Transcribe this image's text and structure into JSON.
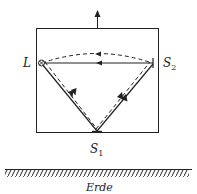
{
  "diagram": {
    "type": "physics-light-clock",
    "labels": {
      "L": "L",
      "S2_base": "S",
      "S2_sub": "2",
      "S1_base": "S",
      "S1_sub": "1",
      "ground": "Erde"
    },
    "elements": {
      "box": "moving-frame-rectangle",
      "motion_arrow": "upward-velocity-arrow",
      "source_marker": "circle-cross-icon",
      "mirror_S2": "vertical-mirror",
      "mirror_S1": "horizontal-mirror",
      "ground": "hatched-ground"
    },
    "paths": [
      {
        "name": "solid-L-S2",
        "style": "solid",
        "direction": "S2 to L"
      },
      {
        "name": "dashed-arc-L-S2",
        "style": "dashed",
        "direction": "S2 to L"
      },
      {
        "name": "solid-L-S1",
        "style": "solid",
        "direction": "L to S1"
      },
      {
        "name": "dashed-L-S1",
        "style": "dashed",
        "direction": "L to S1"
      },
      {
        "name": "solid-S1-S2",
        "style": "solid",
        "direction": "S1 to S2"
      },
      {
        "name": "dashed-S1-S2",
        "style": "dashed",
        "direction": "S1 to S2"
      }
    ],
    "colors": {
      "stroke": "#222222",
      "background": "#ffffff"
    }
  }
}
